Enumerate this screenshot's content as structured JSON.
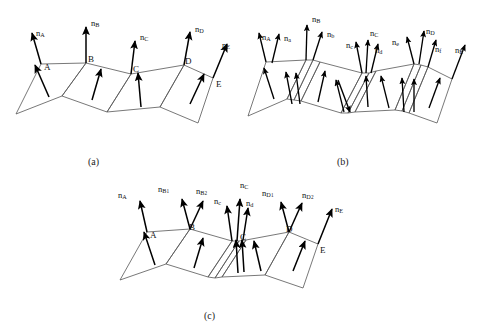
{
  "figure": {
    "background_color": "#ffffff",
    "line_color": "#4a4a4a",
    "arrow_color": "#000000",
    "text_color": "#111111"
  },
  "panels": [
    {
      "id": "a",
      "caption": "(a)",
      "vertex_labels": [
        "A",
        "B",
        "C",
        "D",
        "E"
      ],
      "normal_labels": [
        {
          "base": "n",
          "sub": "A"
        },
        {
          "base": "n",
          "sub": "B"
        },
        {
          "base": "n",
          "sub": "C"
        },
        {
          "base": "n",
          "sub": "D"
        },
        {
          "base": "n",
          "sub": "E"
        }
      ],
      "facet_count": 4,
      "sliver_facets": 0
    },
    {
      "id": "b",
      "caption": "(b)",
      "vertex_labels": [],
      "normal_labels": [
        {
          "base": "n",
          "sub": "A"
        },
        {
          "base": "n",
          "sub": "a"
        },
        {
          "base": "n",
          "sub": "B"
        },
        {
          "base": "n",
          "sub": "b"
        },
        {
          "base": "n",
          "sub": "c"
        },
        {
          "base": "n",
          "sub": "C"
        },
        {
          "base": "n",
          "sub": "d"
        },
        {
          "base": "n",
          "sub": "e"
        },
        {
          "base": "n",
          "sub": "D"
        },
        {
          "base": "n",
          "sub": "f"
        },
        {
          "base": "n",
          "sub": "E"
        }
      ],
      "facet_count": 4,
      "sliver_facets": 4
    },
    {
      "id": "c",
      "caption": "(c)",
      "vertex_labels": [
        "A",
        "B",
        "C",
        "D",
        "E"
      ],
      "normal_labels": [
        {
          "base": "n",
          "sub": "A"
        },
        {
          "base": "n",
          "sub": "B1"
        },
        {
          "base": "n",
          "sub": "B2"
        },
        {
          "base": "n",
          "sub": "c"
        },
        {
          "base": "n",
          "sub": "C"
        },
        {
          "base": "n",
          "sub": "d"
        },
        {
          "base": "n",
          "sub": "D1"
        },
        {
          "base": "n",
          "sub": "D2"
        },
        {
          "base": "n",
          "sub": "E"
        }
      ],
      "facet_count": 4,
      "sliver_facets": 2
    }
  ],
  "labels": {
    "a": {
      "caption": "(a)",
      "nA": "n",
      "nA_sub": "A",
      "nB": "n",
      "nB_sub": "B",
      "nC": "n",
      "nC_sub": "C",
      "nD": "n",
      "nD_sub": "D",
      "nE": "n",
      "nE_sub": "E",
      "vA": "A",
      "vB": "B",
      "vC": "C",
      "vD": "D",
      "vE": "E"
    },
    "b": {
      "caption": "(b)",
      "nA": "n",
      "nA_sub": "A",
      "na": "n",
      "na_sub": "a",
      "nB": "n",
      "nB_sub": "B",
      "nb": "n",
      "nb_sub": "b",
      "nc": "n",
      "nc_sub": "c",
      "nC": "n",
      "nC_sub": "C",
      "nd": "n",
      "nd_sub": "d",
      "ne": "n",
      "ne_sub": "e",
      "nD": "n",
      "nD_sub": "D",
      "nf": "n",
      "nf_sub": "f",
      "nE": "n",
      "nE_sub": "E"
    },
    "c": {
      "caption": "(c)",
      "nA": "n",
      "nA_sub": "A",
      "nB1": "n",
      "nB1_sub": "B1",
      "nB2": "n",
      "nB2_sub": "B2",
      "nc": "n",
      "nc_sub": "c",
      "nC": "n",
      "nC_sub": "C",
      "nd": "n",
      "nd_sub": "d",
      "nD1": "n",
      "nD1_sub": "D1",
      "nD2": "n",
      "nD2_sub": "D2",
      "nE": "n",
      "nE_sub": "E",
      "vA": "A",
      "vB": "B",
      "vC": "C",
      "vD": "D",
      "vE": "E"
    }
  }
}
